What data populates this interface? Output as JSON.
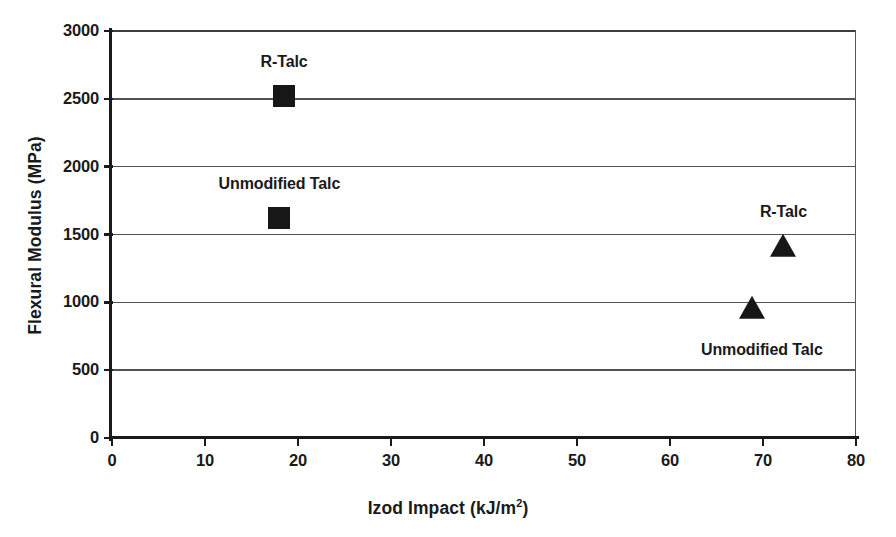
{
  "chart_data": {
    "type": "scatter",
    "title": "",
    "xlabel": "Izod Impact (kJ/m2)",
    "xlabel_base": "Izod Impact (kJ/m",
    "xlabel_sup": "2",
    "xlabel_tail": ")",
    "ylabel": "Flexural Modulus (MPa)",
    "xlim": [
      0,
      80
    ],
    "ylim": [
      0,
      3000
    ],
    "xticks": [
      0,
      10,
      20,
      30,
      40,
      50,
      60,
      70,
      80
    ],
    "yticks": [
      0,
      500,
      1000,
      1500,
      2000,
      2500,
      3000
    ],
    "xtick_labels": [
      "0",
      "10",
      "20",
      "30",
      "40",
      "50",
      "60",
      "70",
      "80"
    ],
    "ytick_labels": [
      "0",
      "500",
      "1000",
      "1500",
      "2000",
      "2500",
      "3000"
    ],
    "grid": "horizontal",
    "legend": "none",
    "marker_color": "#171717",
    "gridline_color": "#4f5356",
    "axis_color": "#1a1a1a",
    "points": [
      {
        "label": "R-Talc",
        "marker": "square",
        "x": 18.5,
        "y": 2520,
        "label_dx": 0,
        "label_dy": -34,
        "label_align": "center"
      },
      {
        "label": "Unmodified Talc",
        "marker": "square",
        "x": 18.0,
        "y": 1620,
        "label_dx": 0,
        "label_dy": -34,
        "label_align": "center"
      },
      {
        "label": "R-Talc",
        "marker": "triangle",
        "x": 72.2,
        "y": 1400,
        "label_dx": 0,
        "label_dy": -36,
        "label_align": "center"
      },
      {
        "label": "Unmodified Talc",
        "marker": "triangle",
        "x": 68.8,
        "y": 940,
        "label_dx": 10,
        "label_dy": 40,
        "label_align": "center"
      }
    ],
    "series": [
      {
        "name": "R-Talc (square)",
        "marker": "square",
        "x": [
          18.5
        ],
        "values": [
          2520
        ]
      },
      {
        "name": "Unmodified Talc (square)",
        "marker": "square",
        "x": [
          18.0
        ],
        "values": [
          1620
        ]
      },
      {
        "name": "R-Talc (triangle)",
        "marker": "triangle",
        "x": [
          72.2
        ],
        "values": [
          1400
        ]
      },
      {
        "name": "Unmodified Talc (triangle)",
        "marker": "triangle",
        "x": [
          68.8
        ],
        "values": [
          940
        ]
      }
    ]
  }
}
